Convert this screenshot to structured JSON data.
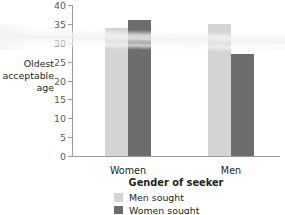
{
  "chart_data": {
    "type": "bar",
    "title": "",
    "xlabel": "Gender of seeker",
    "ylabel": "Oldest\nacceptable\nage",
    "categories": [
      "Women",
      "Men"
    ],
    "series": [
      {
        "name": "Men sought",
        "color": "#d4d4d4",
        "values": [
          34,
          35
        ]
      },
      {
        "name": "Women sought",
        "color": "#6d6d6d",
        "values": [
          36,
          27
        ]
      }
    ],
    "ylim": [
      0,
      40
    ],
    "ytick_labels": [
      "0",
      "5",
      "10",
      "15",
      "20",
      "25",
      "30",
      "35",
      "40"
    ],
    "ytick_values": [
      0,
      5,
      10,
      15,
      20,
      25,
      30,
      35,
      40
    ],
    "ytick_step": 5,
    "grid": false,
    "legend_position": "below-axis-title",
    "legend_entries": [
      "Men sought",
      "Women sought"
    ]
  },
  "axes": {
    "axis_color": "#9b9b9b",
    "tick_label_color": "#58595b",
    "label_color": "#231f20"
  }
}
